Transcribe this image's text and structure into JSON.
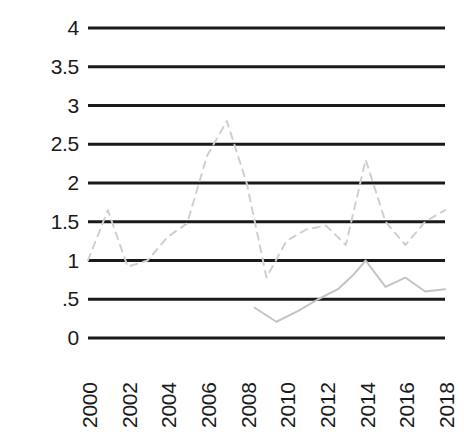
{
  "chart_data": {
    "type": "line",
    "title": "",
    "subtitle": "",
    "xlabel": "",
    "ylabel": "",
    "grid": true,
    "grid_axis": "y",
    "legend": "none",
    "xlim": [
      2000,
      2018
    ],
    "ylim": [
      0,
      4
    ],
    "ytick_labels": [
      "4",
      "3.5",
      "3",
      "2.5",
      "2",
      "1.5",
      "1",
      ".5",
      "0"
    ],
    "ytick_values": [
      4,
      3.5,
      3,
      2.5,
      2,
      1.5,
      1,
      0.5,
      0
    ],
    "xtick_labels": [
      "2000",
      "2002",
      "2004",
      "2006",
      "2008",
      "2010",
      "2012",
      "2014",
      "2016",
      "2018"
    ],
    "xtick_values": [
      2000,
      2002,
      2004,
      2006,
      2008,
      2010,
      2012,
      2014,
      2016,
      2018
    ],
    "x": [
      2000,
      2001,
      2002,
      2003,
      2004,
      2005,
      2006,
      2007,
      2008,
      2009,
      2010,
      2011,
      2012,
      2013,
      2014,
      2015,
      2016,
      2017,
      2018
    ],
    "series": [
      {
        "name": "dashed-series",
        "style": "dashed",
        "color": "#cfcfcf",
        "width": 2,
        "x": [
          2000,
          2001,
          2002,
          2003,
          2004,
          2005,
          2006,
          2007,
          2008,
          2009,
          2010,
          2011,
          2012,
          2013,
          2014,
          2015,
          2016,
          2017,
          2018
        ],
        "values": [
          1.0,
          1.65,
          0.92,
          1.0,
          1.3,
          1.48,
          2.35,
          2.8,
          2.0,
          0.78,
          1.25,
          1.4,
          1.45,
          1.2,
          2.3,
          1.5,
          1.2,
          1.5,
          1.65
        ]
      },
      {
        "name": "solid-series",
        "style": "solid",
        "color": "#c4c4c4",
        "width": 2,
        "x": [
          2008.4,
          2009.5,
          2010.6,
          2011.6,
          2012.6,
          2013.4,
          2014,
          2015,
          2016,
          2017,
          2018
        ],
        "values": [
          0.39,
          0.21,
          0.35,
          0.5,
          0.63,
          0.82,
          1.0,
          0.66,
          0.78,
          0.6,
          0.63
        ]
      }
    ],
    "gridline_color": "#1a1a1a",
    "gridline_width": 3,
    "background": "#ffffff"
  },
  "axis": {
    "y_label_color": "#1a1a1a",
    "x_label_color": "#1a1a1a"
  }
}
